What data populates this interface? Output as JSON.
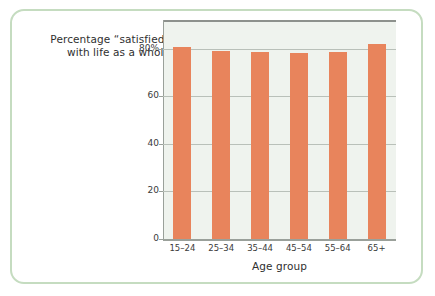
{
  "figure": {
    "background_color": "#ffffff",
    "frame_border_color": "#c5dcc0",
    "plot_background_color": "#eff3ee",
    "bar_color": "#e8845c",
    "gridline_color": "#b9c0b9",
    "axis_color": "#9aa09a"
  },
  "title": {
    "line1": "Percentage “satisfied”",
    "line2": "with life as a whole"
  },
  "axes": {
    "x_label": "Age group",
    "y_label": ""
  },
  "chart_data": {
    "type": "bar",
    "title": "Percentage “satisfied” with life as a whole",
    "xlabel": "Age group",
    "ylabel": "",
    "categories": [
      "15–24",
      "25–34",
      "35–44",
      "45–54",
      "55–64",
      "65+"
    ],
    "values": [
      80.5,
      79,
      78.5,
      78,
      78.5,
      82
    ],
    "ylim": [
      0,
      92
    ],
    "yticks": [
      0,
      20,
      40,
      60,
      80
    ],
    "ytick_labels": [
      "0",
      "20",
      "40",
      "60",
      "80%"
    ],
    "grid": true,
    "legend": false,
    "orientation": "vertical",
    "bar_color": "#e8845c"
  }
}
